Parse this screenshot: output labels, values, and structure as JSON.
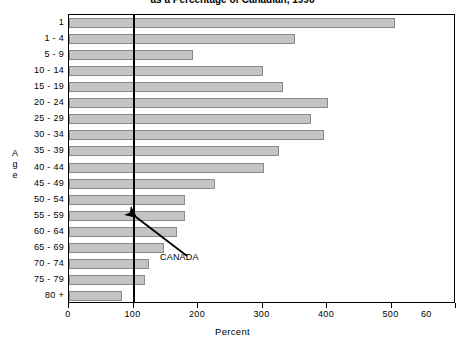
{
  "chart_data": {
    "type": "bar",
    "orientation": "horizontal",
    "title": "as a Percentage of Canadian, 1996",
    "title_clipped": true,
    "xlabel": "Percent",
    "ylabel": "Age",
    "categories": [
      "1",
      "1 - 4",
      "5 - 9",
      "10 - 14",
      "15 - 19",
      "20 - 24",
      "25 - 29",
      "30 - 34",
      "35 - 39",
      "40 - 44",
      "45 - 49",
      "50 - 54",
      "55 - 59",
      "60 - 64",
      "65 - 69",
      "70 - 74",
      "75 - 79",
      "80 +"
    ],
    "values": [
      505,
      350,
      192,
      300,
      332,
      402,
      375,
      395,
      325,
      303,
      226,
      180,
      180,
      168,
      148,
      124,
      118,
      82
    ],
    "xlim": [
      0,
      600
    ],
    "xticks": [
      0,
      100,
      200,
      300,
      400,
      500,
      600
    ],
    "xtick_labels": [
      "0",
      "100",
      "200",
      "300",
      "400",
      "500",
      "60"
    ],
    "grid": false,
    "legend": null,
    "reference_line": {
      "value": 100,
      "label": "CANADA",
      "orientation": "vertical"
    },
    "annotations": [
      {
        "text": "CANADA",
        "points_to": "reference-line-100"
      }
    ],
    "colors": {
      "bar_fill": "#c4c4c4",
      "bar_border": "#8a8a8a",
      "axis": "#000000",
      "reference_line": "#000000",
      "background": "#ffffff"
    }
  },
  "yaxis_title_letters": [
    "A",
    "g",
    "e"
  ]
}
